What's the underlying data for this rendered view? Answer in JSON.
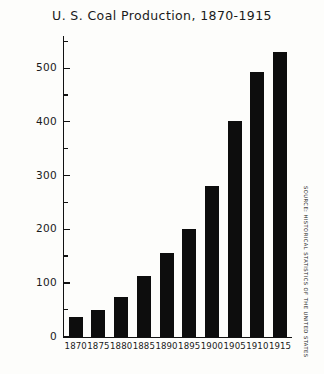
{
  "chart_data": {
    "type": "bar",
    "title": "U. S. Coal Production, 1870-1915",
    "xlabel": "",
    "ylabel": "Millions of tons",
    "categories": [
      "1870",
      "1875",
      "1880",
      "1885",
      "1890",
      "1895",
      "1900",
      "1905",
      "1910",
      "1915"
    ],
    "values": [
      37,
      50,
      73,
      112,
      155,
      200,
      281,
      401,
      493,
      530
    ],
    "ylim": [
      0,
      560
    ],
    "ytick_labels": [
      "0",
      "100",
      "200",
      "300",
      "400",
      "500"
    ],
    "ytick_values": [
      0,
      100,
      200,
      300,
      400,
      500
    ],
    "yminor_values": [
      50,
      150,
      250,
      350,
      450,
      550
    ],
    "grid": false,
    "legend": false,
    "bar_color": "#0d0d0d",
    "axis_color": "#111111",
    "background": "#fdfdfb"
  },
  "annotations": {
    "source_note": "SOURCE: HISTORICAL STATISTICS OF THE UNITED STATES"
  }
}
